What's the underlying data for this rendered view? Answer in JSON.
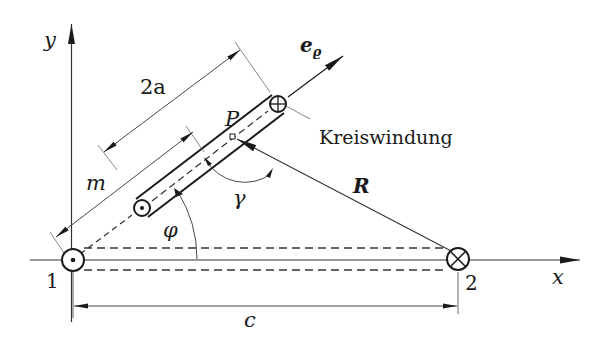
{
  "diagram": {
    "labels": {
      "y_axis": "y",
      "x_axis": "x",
      "e_rho": "e",
      "e_rho_sub": "ϱ",
      "two_a": "2a",
      "m": "m",
      "P": "P",
      "coil": "Kreiswindung",
      "R": "R",
      "gamma": "γ",
      "phi": "φ",
      "point1": "1",
      "point2": "2",
      "c": "c"
    },
    "symbols": {
      "conductor_1": "current-out-of-page (dot)",
      "conductor_2": "current-into-page (cross)",
      "coil_lower_end": "current-out-of-page (dot)",
      "coil_upper_end": "current-into-page (cross)"
    },
    "colors": {
      "ink": "#1a1a1a",
      "thin_line": "#555555",
      "background": "#ffffff"
    }
  }
}
